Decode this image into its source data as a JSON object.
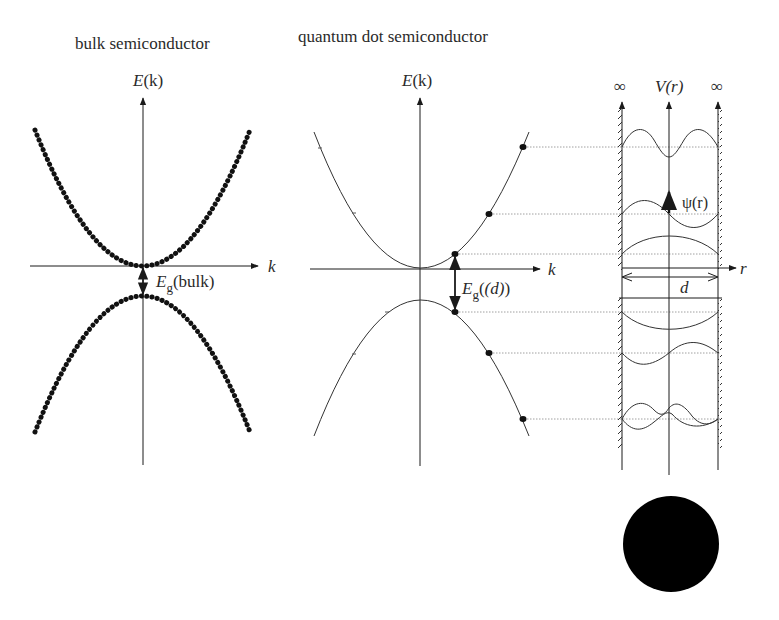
{
  "panels": {
    "bulk": {
      "title": "bulk semiconductor",
      "y_axis_label": "E(k)",
      "y_axis_label_E": "E",
      "y_axis_label_arg": "(k)",
      "x_axis_label": "k",
      "gap_label_E": "E",
      "gap_label_sub": "g",
      "gap_label_arg": "(bulk)",
      "band_style": "dense dots (continuous bands)"
    },
    "quantum_dot": {
      "title": "quantum dot semiconductor",
      "y_axis_label_E": "E",
      "y_axis_label_arg": "(k)",
      "x_axis_label": "k",
      "gap_label_E": "E",
      "gap_label_sub": "g",
      "gap_label_arg": "(d)",
      "band_style": "thin curve with discrete states",
      "discrete_states_conduction": 3,
      "discrete_states_valence": 3
    },
    "potential_well": {
      "y_axis_label": "V(r)",
      "left_wall_label": "∞",
      "right_wall_label": "∞",
      "x_axis_label": "r",
      "width_label": "d",
      "wavefunction_label": "ψ(r)",
      "wavefunctions_upper": 3,
      "wavefunctions_lower": 3
    },
    "dot": {
      "description": "filled black circle representing the quantum dot",
      "color": "#000000"
    }
  },
  "colors": {
    "ink": "#1a1a1a",
    "dotted_guides": "#9a9a9a",
    "background": "#ffffff"
  }
}
